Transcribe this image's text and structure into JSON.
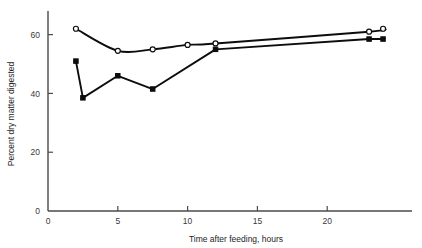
{
  "chart_data": {
    "type": "line",
    "title": "",
    "subtitle": "",
    "xlabel": "Time after feeding, hours",
    "ylabel": "Percent dry matter digested",
    "xlim": [
      0,
      25.5
    ],
    "ylim": [
      0,
      66
    ],
    "xticks": [
      0,
      5,
      10,
      15,
      20
    ],
    "xticklabels": [
      "0",
      "5",
      "10",
      "15",
      "20"
    ],
    "yticks": [
      0,
      20,
      40,
      60
    ],
    "yticklabels": [
      "0",
      "20",
      "40",
      "60"
    ],
    "grid": false,
    "legend": "none",
    "series": [
      {
        "name": "open-circle-series",
        "marker": "open-circle",
        "smooth": true,
        "x": [
          2,
          5,
          7.5,
          10,
          12,
          23,
          24
        ],
        "values": [
          62,
          54.5,
          55,
          56.5,
          57,
          61,
          62
        ]
      },
      {
        "name": "filled-square-series",
        "marker": "filled-square",
        "smooth": false,
        "x": [
          2,
          2.5,
          5,
          7.5,
          12,
          23,
          24
        ],
        "values": [
          51,
          38.5,
          46,
          41.5,
          55,
          58.5,
          58.5
        ]
      }
    ]
  },
  "axes": {
    "x_title": "Time after feeding, hours",
    "y_title": "Percent dry matter digested"
  }
}
